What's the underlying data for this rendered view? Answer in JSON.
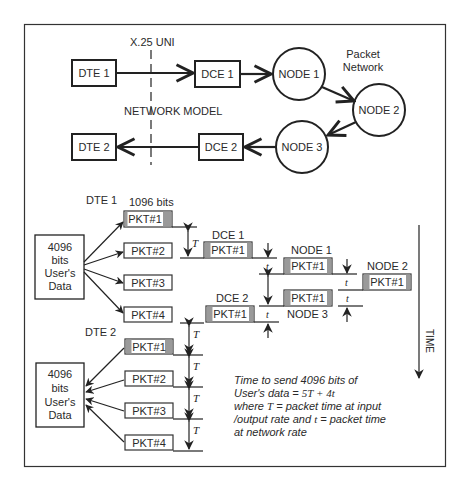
{
  "network_model": {
    "interface_label": "X.25 UNI",
    "title": "NETWORK MODEL",
    "cloud_label_line1": "Packet",
    "cloud_label_line2": "Network",
    "dte1": "DTE 1",
    "dce1": "DCE 1",
    "dte2": "DTE 2",
    "dce2": "DCE 2",
    "node1": "NODE 1",
    "node2": "NODE 2",
    "node3": "NODE 3"
  },
  "timing": {
    "dte1_label": "DTE 1",
    "dte2_label": "DTE 2",
    "dce1_label": "DCE 1",
    "dce2_label": "DCE 2",
    "node1_label": "NODE 1",
    "node2_label": "NODE 2",
    "node3_label": "NODE 3",
    "packet_size_label": "1096 bits",
    "user_data_top": [
      "4096",
      "bits",
      "User's",
      "Data"
    ],
    "user_data_bottom": [
      "4096",
      "bits",
      "User's",
      "Data"
    ],
    "dte1_packets": [
      "PKT#1",
      "PKT#2",
      "PKT#3",
      "PKT#4"
    ],
    "dte2_packets": [
      "PKT#1",
      "PKT#2",
      "PKT#3",
      "PKT#4"
    ],
    "network_packet": "PKT#1",
    "T_symbol": "T",
    "t_symbol": "t",
    "time_axis_label": "TIME"
  },
  "note": {
    "line1": "Time to send 4096 bits of",
    "line2_prefix": "User's data = ",
    "line2_formula": "5T + 4t",
    "line3_prefix": "where ",
    "line3_T": "T",
    "line3_rest": " = packet time at input",
    "line4_prefix": "/output rate and ",
    "line4_t": "t",
    "line4_rest": " = packet time",
    "line5": "at network rate"
  },
  "colors": {
    "stroke": "#222222",
    "packet_stripe": "#9a9a9a",
    "background": "#ffffff"
  }
}
